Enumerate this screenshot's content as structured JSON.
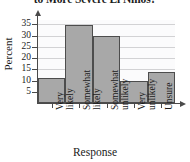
{
  "chart_data": {
    "type": "bar",
    "title": "to More Severe El Niños?",
    "xlabel": "Response",
    "ylabel": "Percent",
    "categories": [
      "Very likely",
      "Somewhat likely",
      "Somewhat unlikely",
      "Very unlikely",
      "Unsure"
    ],
    "category_lines": [
      [
        "Very",
        "likely"
      ],
      [
        "Somewhat",
        "likely"
      ],
      [
        "Somewhat",
        "unlikely"
      ],
      [
        "Very",
        "unlikely"
      ],
      [
        "Unsure",
        ""
      ]
    ],
    "values": [
      11,
      35,
      30,
      10,
      14
    ],
    "ylim": [
      0,
      37
    ],
    "yticks": [
      5,
      10,
      15,
      20,
      25,
      30,
      35
    ],
    "ytick_labels": [
      "5",
      "10",
      "15",
      "20",
      "25",
      "30",
      "35"
    ],
    "grid": true,
    "legend": false,
    "colors": {
      "bar_fill": "#a8a8a8",
      "bar_edge": "#4d4d4d",
      "plot_background": "#fbfbfc",
      "gridline": "#d2d2d4",
      "axis": "#4a4a4a",
      "text": "#1a1a1a"
    }
  }
}
